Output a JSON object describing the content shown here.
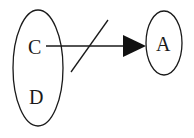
{
  "diagram": {
    "type": "set-mapping",
    "nodes": [
      {
        "id": "left-set",
        "shape": "ellipse",
        "labels": [
          "C",
          "D"
        ]
      },
      {
        "id": "right-set",
        "shape": "ellipse",
        "labels": [
          "A"
        ]
      }
    ],
    "edges": [
      {
        "from": "C",
        "to": "A",
        "style": "arrow",
        "negated": true,
        "marker": "slash"
      }
    ],
    "colors": {
      "stroke": "#1a1a1a",
      "background": "#ffffff"
    }
  },
  "labels": {
    "c": "C",
    "d": "D",
    "a": "A"
  }
}
